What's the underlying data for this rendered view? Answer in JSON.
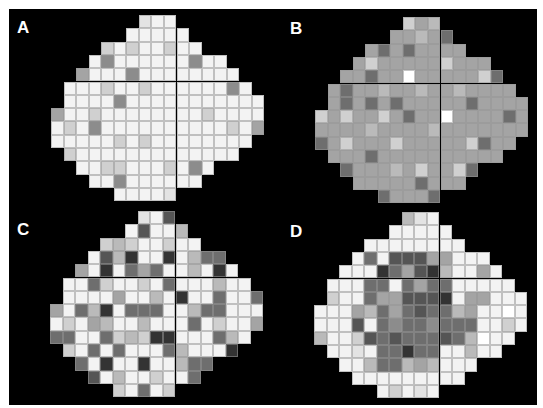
{
  "figure": {
    "background": "#000000",
    "cell_width": 12.55,
    "cell_height": 13.3,
    "gray_scale": {
      "1": "#333333",
      "2": "#555555",
      "3": "#6e6e6e",
      "4": "#8c8c8c",
      "5": "#a4a4a4",
      "6": "#bababa",
      "7": "#d0d0d0",
      "8": "#e3e3e3",
      "9": "#f3f3f3",
      "10": "#ffffff"
    },
    "row_shape": [
      [
        7,
        3
      ],
      [
        6,
        5
      ],
      [
        4,
        8
      ],
      [
        3,
        11
      ],
      [
        2,
        13
      ],
      [
        1,
        15
      ],
      [
        1,
        16
      ],
      [
        0,
        17
      ],
      [
        0,
        17
      ],
      [
        0,
        16
      ],
      [
        1,
        14
      ],
      [
        2,
        11
      ],
      [
        3,
        9
      ],
      [
        5,
        5
      ]
    ]
  },
  "panels": [
    {
      "label": "A",
      "x": 51,
      "y": 15,
      "label_x": 17,
      "label_y": 19,
      "rows": [
        [
          8,
          9,
          9
        ],
        [
          9,
          9,
          9,
          9,
          9
        ],
        [
          7,
          9,
          7,
          9,
          9,
          7,
          9,
          9
        ],
        [
          9,
          4,
          9,
          9,
          9,
          9,
          9,
          9,
          4,
          9,
          9
        ],
        [
          5,
          9,
          9,
          9,
          4,
          9,
          9,
          9,
          9,
          9,
          9,
          9,
          9
        ],
        [
          9,
          9,
          9,
          7,
          9,
          9,
          7,
          9,
          9,
          9,
          9,
          9,
          9,
          4,
          9
        ],
        [
          9,
          9,
          9,
          9,
          4,
          9,
          9,
          9,
          9,
          9,
          9,
          9,
          9,
          9,
          9,
          9
        ],
        [
          5,
          9,
          9,
          7,
          9,
          9,
          9,
          9,
          9,
          9,
          9,
          9,
          7,
          9,
          9,
          9,
          9
        ],
        [
          9,
          7,
          9,
          4,
          9,
          9,
          9,
          9,
          9,
          9,
          9,
          9,
          9,
          9,
          7,
          9,
          5
        ],
        [
          9,
          9,
          9,
          9,
          9,
          7,
          9,
          7,
          9,
          9,
          9,
          9,
          9,
          9,
          9,
          9
        ],
        [
          7,
          9,
          9,
          9,
          9,
          9,
          9,
          9,
          9,
          9,
          9,
          9,
          9,
          9
        ],
        [
          9,
          9,
          7,
          7,
          9,
          9,
          9,
          7,
          9,
          4,
          9
        ],
        [
          9,
          9,
          4,
          9,
          9,
          9,
          9,
          9,
          9
        ],
        [
          9,
          9,
          9,
          9,
          8
        ]
      ]
    },
    {
      "label": "B",
      "x": 315,
      "y": 17,
      "label_x": 290,
      "label_y": 20,
      "rows": [
        [
          7,
          5,
          6
        ],
        [
          5,
          5,
          6,
          5,
          3
        ],
        [
          5,
          3,
          5,
          3,
          5,
          5,
          5,
          5
        ],
        [
          5,
          7,
          5,
          5,
          5,
          5,
          5,
          7,
          5,
          5,
          5
        ],
        [
          5,
          5,
          3,
          5,
          5,
          10,
          5,
          5,
          5,
          5,
          5,
          7,
          3
        ],
        [
          5,
          3,
          5,
          5,
          6,
          5,
          5,
          6,
          5,
          5,
          6,
          5,
          5,
          5,
          5
        ],
        [
          5,
          3,
          5,
          3,
          5,
          3,
          5,
          5,
          5,
          5,
          5,
          3,
          5,
          5,
          5,
          5
        ],
        [
          7,
          5,
          7,
          5,
          5,
          7,
          5,
          3,
          5,
          5,
          10,
          5,
          5,
          5,
          5,
          3,
          5
        ],
        [
          5,
          5,
          5,
          5,
          6,
          5,
          5,
          5,
          5,
          6,
          5,
          5,
          5,
          5,
          5,
          5,
          5
        ],
        [
          3,
          5,
          7,
          5,
          5,
          5,
          7,
          5,
          5,
          5,
          5,
          5,
          7,
          3,
          5,
          5
        ],
        [
          5,
          5,
          5,
          3,
          5,
          5,
          5,
          5,
          5,
          5,
          5,
          5,
          5,
          5
        ],
        [
          3,
          5,
          5,
          5,
          6,
          5,
          7,
          5,
          5,
          7,
          3
        ],
        [
          5,
          5,
          5,
          5,
          5,
          3,
          5,
          5,
          5
        ],
        [
          3,
          5,
          5,
          5,
          3
        ]
      ]
    },
    {
      "label": "C",
      "x": 50,
      "y": 211,
      "label_x": 17,
      "label_y": 221,
      "rows": [
        [
          8,
          9,
          2
        ],
        [
          9,
          2,
          9,
          9,
          6
        ],
        [
          7,
          6,
          7,
          9,
          9,
          7,
          9,
          9
        ],
        [
          9,
          2,
          6,
          1,
          9,
          9,
          1,
          9,
          6,
          3,
          3
        ],
        [
          5,
          9,
          1,
          9,
          3,
          5,
          3,
          9,
          9,
          6,
          9,
          1,
          9
        ],
        [
          9,
          9,
          3,
          7,
          9,
          9,
          7,
          9,
          3,
          9,
          9,
          9,
          6,
          9,
          9
        ],
        [
          9,
          9,
          9,
          9,
          5,
          9,
          9,
          6,
          9,
          1,
          9,
          9,
          3,
          9,
          9,
          3
        ],
        [
          5,
          9,
          3,
          6,
          1,
          9,
          3,
          3,
          3,
          9,
          9,
          6,
          3,
          3,
          9,
          9,
          9
        ],
        [
          9,
          7,
          9,
          5,
          6,
          9,
          9,
          6,
          9,
          9,
          9,
          3,
          9,
          7,
          9,
          9,
          5
        ],
        [
          3,
          3,
          9,
          9,
          3,
          7,
          6,
          7,
          1,
          1,
          9,
          9,
          9,
          3,
          6,
          9
        ],
        [
          7,
          9,
          3,
          9,
          3,
          9,
          9,
          9,
          3,
          6,
          9,
          9,
          9,
          1
        ],
        [
          3,
          9,
          1,
          9,
          9,
          1,
          9,
          9,
          6,
          3,
          3
        ],
        [
          2,
          9,
          6,
          9,
          9,
          7,
          9,
          9,
          3
        ],
        [
          7,
          9,
          3,
          9,
          7
        ]
      ]
    },
    {
      "label": "D",
      "x": 314,
      "y": 212,
      "label_x": 290,
      "label_y": 223,
      "rows": [
        [
          6,
          8,
          9
        ],
        [
          9,
          9,
          9,
          9,
          9
        ],
        [
          9,
          9,
          9,
          9,
          9,
          9,
          9,
          9
        ],
        [
          9,
          3,
          9,
          2,
          2,
          2,
          5,
          5,
          9,
          9,
          9
        ],
        [
          9,
          9,
          9,
          1,
          3,
          5,
          2,
          1,
          6,
          9,
          9,
          5,
          9
        ],
        [
          9,
          9,
          9,
          3,
          3,
          9,
          3,
          5,
          3,
          3,
          9,
          9,
          9,
          9,
          9
        ],
        [
          7,
          9,
          9,
          3,
          5,
          5,
          2,
          2,
          2,
          1,
          9,
          5,
          5,
          9,
          9,
          9
        ],
        [
          9,
          9,
          9,
          5,
          6,
          3,
          5,
          3,
          2,
          3,
          3,
          6,
          5,
          9,
          9,
          10,
          9
        ],
        [
          9,
          9,
          9,
          2,
          9,
          3,
          4,
          3,
          3,
          4,
          3,
          3,
          3,
          9,
          9,
          7,
          9
        ],
        [
          6,
          9,
          9,
          7,
          2,
          3,
          2,
          3,
          3,
          3,
          2,
          3,
          6,
          10,
          9,
          9
        ],
        [
          9,
          9,
          8,
          9,
          3,
          3,
          1,
          3,
          3,
          9,
          9,
          6,
          9,
          9
        ],
        [
          9,
          9,
          6,
          3,
          3,
          6,
          5,
          6,
          9,
          9,
          9
        ],
        [
          9,
          9,
          9,
          9,
          9,
          9,
          9,
          9,
          9
        ],
        [
          9,
          7,
          9,
          8,
          9
        ]
      ]
    }
  ]
}
